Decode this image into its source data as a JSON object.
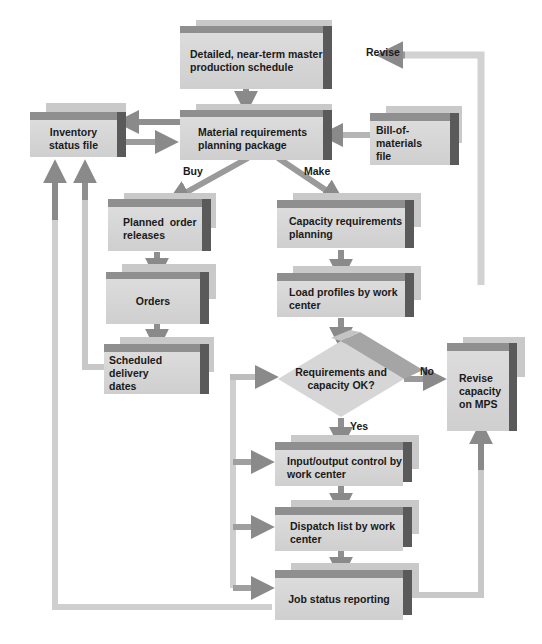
{
  "diagram": {
    "nodes": {
      "mps": {
        "line1": "Detailed, near-term master",
        "line2": "production schedule"
      },
      "mrp": {
        "line1": "Material requirements",
        "line2": "planning package"
      },
      "inventory": {
        "line1": "Inventory",
        "line2": "status file"
      },
      "bom": {
        "line1": "Bill-of-materials",
        "line2": "file"
      },
      "planned_orders": {
        "line1": "Planned  order",
        "line2": "releases"
      },
      "orders": {
        "line1": "Orders"
      },
      "scheduled_delivery": {
        "line1": "Scheduled delivery",
        "line2": "dates"
      },
      "crp": {
        "line1": "Capacity requirements",
        "line2": "planning"
      },
      "load_profiles": {
        "line1": "Load profiles by work",
        "line2": "center"
      },
      "decision": {
        "line1": "Requirements and",
        "line2": "capacity OK?"
      },
      "revise_capacity": {
        "line1": "Revise",
        "line2": "capacity",
        "line3": "on MPS"
      },
      "io_control": {
        "line1": "Input/output control by",
        "line2": "work center"
      },
      "dispatch": {
        "line1": "Dispatch list by work",
        "line2": "center"
      },
      "job_status": {
        "line1": "Job status reporting"
      }
    },
    "edge_labels": {
      "revise": "Revise",
      "buy": "Buy",
      "make": "Make",
      "no": "No",
      "yes": "Yes"
    },
    "colors": {
      "face": "#d6d6d6",
      "top": "#8f8f8f",
      "side": "#5a5a5a",
      "shadow": "#c9c9c9",
      "arrow_dark": "#8a8a8a",
      "arrow_light": "#cfcfcf"
    }
  }
}
